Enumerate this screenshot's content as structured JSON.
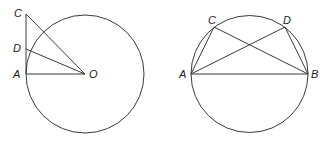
{
  "figures": [
    {
      "id": "tangent-figure",
      "circle": {
        "cx": 85,
        "cy": 74,
        "r": 59
      },
      "points": {
        "C": {
          "label": "C",
          "x": 26,
          "y": 14,
          "lx": 14,
          "ly": 17
        },
        "D": {
          "label": "D",
          "x": 26,
          "y": 49,
          "lx": 13,
          "ly": 52
        },
        "A": {
          "label": "A",
          "x": 26,
          "y": 74,
          "lx": 13,
          "ly": 78
        },
        "O": {
          "label": "O",
          "x": 85,
          "y": 74,
          "lx": 89,
          "ly": 78
        }
      },
      "segments": [
        [
          "C",
          "A"
        ],
        [
          "A",
          "O"
        ],
        [
          "C",
          "O"
        ],
        [
          "D",
          "O"
        ]
      ]
    },
    {
      "id": "inscribed-figure",
      "circle": {
        "cx": 249.5,
        "cy": 74,
        "r": 58.5
      },
      "points": {
        "A": {
          "label": "A",
          "x": 191,
          "y": 74,
          "lx": 179,
          "ly": 78
        },
        "B": {
          "label": "B",
          "x": 308,
          "y": 74,
          "lx": 311,
          "ly": 78
        },
        "C": {
          "label": "C",
          "x": 214,
          "y": 27,
          "lx": 208,
          "ly": 24
        },
        "D": {
          "label": "D",
          "x": 285,
          "y": 27,
          "lx": 283,
          "ly": 24
        }
      },
      "segments": [
        [
          "A",
          "B"
        ],
        [
          "A",
          "C"
        ],
        [
          "A",
          "D"
        ],
        [
          "C",
          "B"
        ],
        [
          "D",
          "B"
        ]
      ]
    }
  ],
  "colors": {
    "stroke": "#3a3a3a",
    "text": "#222222",
    "background": "#ffffff"
  }
}
